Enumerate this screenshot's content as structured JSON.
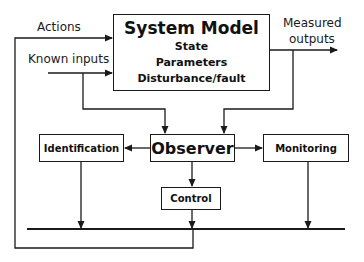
{
  "diagram": {
    "title": "System Model",
    "system_model": {
      "title": "System Model",
      "items": [
        "State",
        "Parameters",
        "Disturbance/fault"
      ]
    },
    "labels": {
      "actions": "Actions",
      "known_inputs": "Known inputs",
      "measured_outputs_line1": "Measured",
      "measured_outputs_line2": "outputs"
    },
    "blocks": {
      "observer": "Observer",
      "identification": "Identification",
      "monitoring": "Monitoring",
      "control": "Control"
    },
    "colors": {
      "line": "#1a1a1a",
      "background": "#ffffff"
    }
  }
}
